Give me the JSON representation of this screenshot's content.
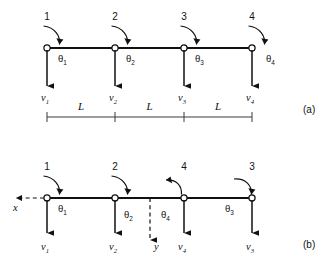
{
  "figure": {
    "background_color": "#ffffff",
    "line_color": "#111111"
  },
  "panels": [
    {
      "id": "a",
      "label": "(a)",
      "beam": {
        "x1": 47,
        "x2": 252,
        "y": 48
      },
      "nodes": [
        {
          "number": "1",
          "x": 47,
          "theta": "θ",
          "theta_sub": "1",
          "v": "v",
          "v_sub": "1"
        },
        {
          "number": "2",
          "x": 115,
          "theta": "θ",
          "theta_sub": "2",
          "v": "v",
          "v_sub": "2"
        },
        {
          "number": "3",
          "x": 184,
          "theta": "θ",
          "theta_sub": "3",
          "v": "v",
          "v_sub": "3"
        },
        {
          "number": "4",
          "x": 252,
          "theta": "θ",
          "theta_sub": "4",
          "v": "v",
          "v_sub": "4"
        }
      ],
      "dimensions": {
        "line_y": 117,
        "labels": [
          "L",
          "L",
          "L"
        ],
        "tick_x": [
          47,
          115,
          184,
          252
        ]
      }
    },
    {
      "id": "b",
      "label": "(b)",
      "beam": {
        "x1": 47,
        "x2": 252,
        "y": 198
      },
      "nodes": [
        {
          "number": "1",
          "x": 47,
          "theta": "θ",
          "theta_sub": "1",
          "v": "v",
          "v_sub": "1"
        },
        {
          "number": "2",
          "x": 115,
          "theta": "θ",
          "theta_sub": "2",
          "v": "v",
          "v_sub": "2"
        },
        {
          "number": "4",
          "x": 184,
          "theta": "θ",
          "theta_sub": "4",
          "v": "v",
          "v_sub": "4"
        },
        {
          "number": "3",
          "x": 252,
          "theta": "θ",
          "theta_sub": "3",
          "v": "v",
          "v_sub": "3"
        }
      ],
      "axes": [
        {
          "name": "x",
          "label": "x",
          "direction": "left",
          "from_x": 47,
          "to_x": 10,
          "y": 198
        },
        {
          "name": "y",
          "label": "y",
          "direction": "down",
          "x": 150,
          "from_y": 198,
          "to_y": 245
        }
      ]
    }
  ],
  "icons": {
    "moment_arc": "curved-moment-arrow-icon",
    "shear_arrow": "down-arrow-icon",
    "x_axis_arrow": "left-arrow-icon",
    "y_axis_arrow": "down-arrow-icon",
    "dimension_tick": "tick-mark-icon",
    "node_marker": "hollow-circle-node-icon"
  }
}
